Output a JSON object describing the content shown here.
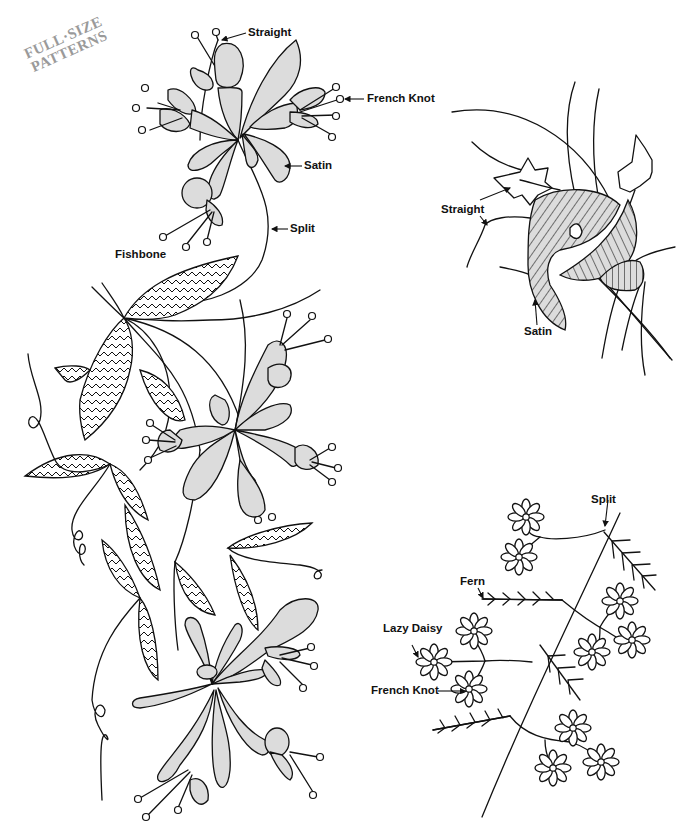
{
  "stamp": {
    "line1": "FULL·SIZE",
    "line2": "PATTERNS"
  },
  "labels": {
    "top_left_straight": "Straight",
    "top_left_french_knot": "French Knot",
    "top_left_satin": "Satin",
    "top_left_split": "Split",
    "left_fishbone": "Fishbone",
    "right_top_straight": "Straight",
    "right_top_satin": "Satin",
    "right_bottom_split": "Split",
    "right_bottom_fern": "Fern",
    "right_bottom_lazy_daisy": "Lazy Daisy",
    "right_bottom_french_knot": "French Knot"
  },
  "colors": {
    "line": "#111111",
    "fill": "#dcdcdc",
    "stamp": "#9a9a9a",
    "background": "#ffffff"
  }
}
